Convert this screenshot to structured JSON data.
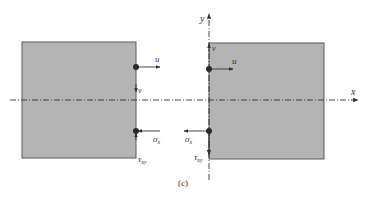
{
  "figure": {
    "caption": "(c)",
    "colors": {
      "block_fill": "#b4b4b4",
      "block_stroke": "#5a5a5a",
      "line": "#333333",
      "node": "#2a2a2a",
      "background": "#ffffff"
    },
    "axes": {
      "x_label": "x",
      "y_label": "y"
    },
    "left_block": {
      "top_node": {
        "displacement_u": "u",
        "displacement_v": "v"
      },
      "bottom_node": {
        "stress_sigma": "σ",
        "stress_sigma_sub": "x",
        "stress_tau": "τ",
        "stress_tau_sub": "xy"
      }
    },
    "right_block": {
      "top_node": {
        "displacement_u": "u",
        "displacement_v": "v"
      },
      "bottom_node": {
        "stress_sigma": "σ",
        "stress_sigma_sub": "x",
        "stress_tau": "τ",
        "stress_tau_sub": "xy"
      }
    }
  }
}
